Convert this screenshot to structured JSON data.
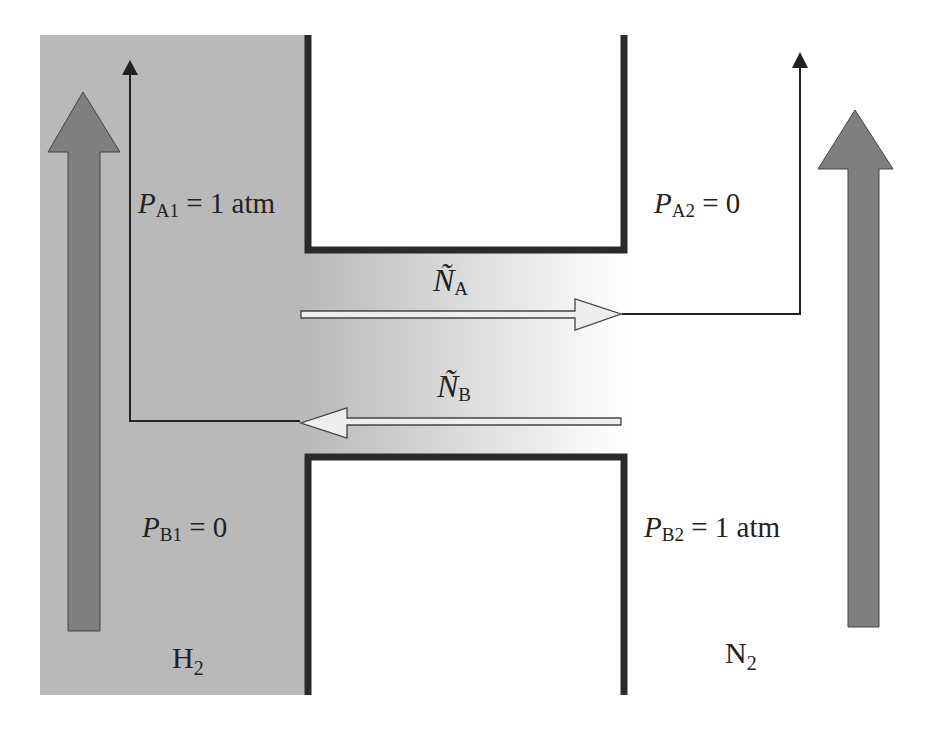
{
  "figure": {
    "type": "equimolar counter-diffusion diagram",
    "left_reservoir": {
      "gas": "H",
      "gas_sub": "2",
      "color": "#b8b8b8"
    },
    "right_reservoir": {
      "gas": "N",
      "gas_sub": "2",
      "color": "#ffffff"
    },
    "labels": {
      "pa1": {
        "sym": "P",
        "sub": "A1",
        "rest": " = 1 atm"
      },
      "pa2": {
        "sym": "P",
        "sub": "A2",
        "rest": " = 0"
      },
      "pb1": {
        "sym": "P",
        "sub": "B1",
        "rest": " = 0"
      },
      "pb2": {
        "sym": "P",
        "sub": "B2",
        "rest": " = 1 atm"
      },
      "na": {
        "sym": "Ñ",
        "sub": "A"
      },
      "nb": {
        "sym": "Ñ",
        "sub": "B"
      }
    },
    "colors": {
      "wall": "#2a2a2a",
      "flow_arrow": "#7f7f7f",
      "line": "#222222"
    }
  }
}
